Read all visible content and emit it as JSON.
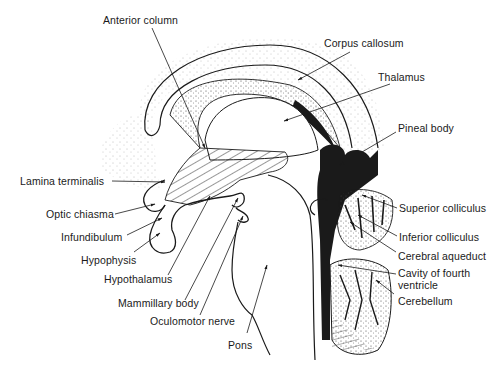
{
  "diagram": {
    "style": "black-and-white line drawing",
    "colors": {
      "ink": "#1a1a1a",
      "background": "#ffffff",
      "stipple": "#555555"
    },
    "labels": [
      {
        "id": "anterior-column",
        "text": "Anterior column",
        "x": 103,
        "y": 14,
        "line": [
          [
            152,
            28
          ],
          [
            205,
            148
          ]
        ]
      },
      {
        "id": "corpus-callosum",
        "text": "Corpus callosum",
        "x": 324,
        "y": 37,
        "line": [
          [
            350,
            52
          ],
          [
            298,
            80
          ]
        ]
      },
      {
        "id": "thalamus",
        "text": "Thalamus",
        "x": 378,
        "y": 71,
        "line": [
          [
            390,
            84
          ],
          [
            284,
            121
          ]
        ]
      },
      {
        "id": "pineal-body",
        "text": "Pineal body",
        "x": 398,
        "y": 122,
        "line": [
          [
            396,
            132
          ],
          [
            340,
            165
          ]
        ]
      },
      {
        "id": "lamina-terminalis",
        "text": "Lamina terminalis",
        "x": 20,
        "y": 175,
        "line": [
          [
            112,
            181
          ],
          [
            165,
            182
          ]
        ]
      },
      {
        "id": "optic-chiasma",
        "text": "Optic chiasma",
        "x": 46,
        "y": 208,
        "line": [
          [
            115,
            214
          ],
          [
            155,
            204
          ]
        ]
      },
      {
        "id": "infundibulum",
        "text": "Infundibulum",
        "x": 61,
        "y": 231,
        "line": [
          [
            127,
            235
          ],
          [
            162,
            218
          ]
        ]
      },
      {
        "id": "hypophysis",
        "text": "Hypophysis",
        "x": 81,
        "y": 254,
        "line": [
          [
            134,
            252
          ],
          [
            160,
            233
          ]
        ]
      },
      {
        "id": "hypothalamus",
        "text": "Hypothalamus",
        "x": 104,
        "y": 273,
        "line": [
          [
            168,
            275
          ],
          [
            210,
            196
          ]
        ]
      },
      {
        "id": "mammillary-body",
        "text": "Mammillary body",
        "x": 118,
        "y": 297,
        "line": [
          [
            185,
            300
          ],
          [
            238,
            198
          ]
        ]
      },
      {
        "id": "oculomotor-nerve",
        "text": "Oculomotor nerve",
        "x": 150,
        "y": 315,
        "line": [
          [
            200,
            315
          ],
          [
            243,
            216
          ]
        ]
      },
      {
        "id": "pons",
        "text": "Pons",
        "x": 228,
        "y": 339,
        "line": [
          [
            247,
            333
          ],
          [
            267,
            265
          ]
        ]
      },
      {
        "id": "superior-colliculus",
        "text": "Superior colliculus",
        "x": 399,
        "y": 202,
        "line": [
          [
            397,
            208
          ],
          [
            362,
            195
          ]
        ]
      },
      {
        "id": "inferior-colliculus",
        "text": "Inferior colliculus",
        "x": 399,
        "y": 231,
        "line": [
          [
            397,
            236
          ],
          [
            358,
            215
          ]
        ]
      },
      {
        "id": "cerebral-aqueduct",
        "text": "Cerebral aqueduct",
        "x": 398,
        "y": 250,
        "line": [
          [
            396,
            252
          ],
          [
            350,
            222
          ]
        ]
      },
      {
        "id": "cavity-of-fourth-ventricle",
        "text": "Cavity of fourth ventricle",
        "x": 398,
        "y": 267,
        "line": [
          [
            396,
            274
          ],
          [
            338,
            265
          ]
        ]
      },
      {
        "id": "cerebellum",
        "text": "Cerebellum",
        "x": 398,
        "y": 295,
        "line": [
          [
            394,
            294
          ],
          [
            376,
            280
          ]
        ]
      }
    ]
  }
}
